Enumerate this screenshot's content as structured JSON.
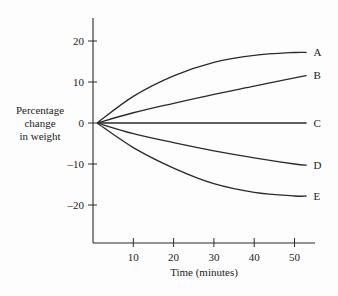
{
  "chart_data": {
    "type": "line",
    "title": "",
    "xlabel": "Time (minutes)",
    "ylabel": "Percentage change in weight",
    "ylabel_lines": [
      "Percentage",
      "change",
      "in weight"
    ],
    "x_ticks": [
      10,
      20,
      30,
      40,
      50
    ],
    "y_ticks": [
      20,
      10,
      0,
      -10,
      -20
    ],
    "xlim": [
      0,
      55
    ],
    "ylim": [
      -29,
      24
    ],
    "grid": false,
    "legend": "inline labels at right end of each curve",
    "x": [
      1,
      10,
      20,
      30,
      40,
      50,
      53
    ],
    "series": [
      {
        "name": "A",
        "values": [
          0,
          6.5,
          11.5,
          14.8,
          16.5,
          17.2,
          17.2
        ]
      },
      {
        "name": "B",
        "values": [
          0,
          2.5,
          4.8,
          7.0,
          9.0,
          11.0,
          11.6
        ]
      },
      {
        "name": "C",
        "values": [
          0,
          0,
          0,
          0,
          0,
          0,
          0
        ]
      },
      {
        "name": "D",
        "values": [
          0,
          -2.6,
          -4.8,
          -6.8,
          -8.5,
          -10.0,
          -10.3
        ]
      },
      {
        "name": "E",
        "values": [
          0,
          -6.0,
          -11.0,
          -14.8,
          -16.9,
          -17.8,
          -17.8
        ]
      }
    ]
  }
}
